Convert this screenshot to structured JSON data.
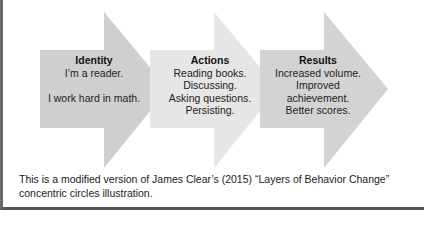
{
  "diagram": {
    "type": "process-arrows",
    "arrows": [
      {
        "title": "Identity",
        "lines": [
          "I’m a reader.",
          "",
          "I work hard in math."
        ],
        "color": "#cfcfcf"
      },
      {
        "title": "Actions",
        "lines": [
          "Reading books.",
          "Discussing.",
          "Asking questions.",
          "Persisting."
        ],
        "color": "#e6e6e6"
      },
      {
        "title": "Results",
        "lines": [
          "Increased volume.",
          "Improved",
          "achievement.",
          "Better scores."
        ],
        "color": "#d3d3d3"
      }
    ]
  },
  "caption": {
    "line1": "This is a modified version of James Clear’s (2015) “Layers of Behavior Change”",
    "line2": "concentric circles illustration."
  }
}
